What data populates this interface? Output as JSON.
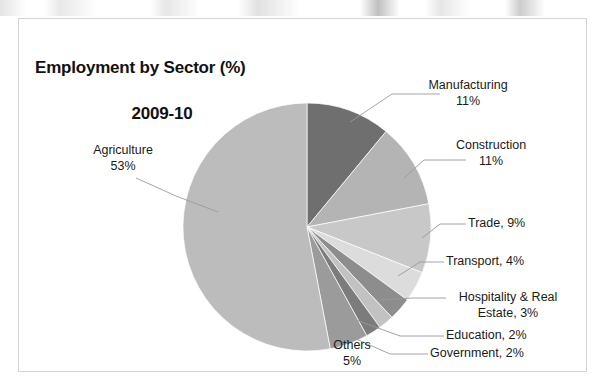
{
  "chart_data": {
    "type": "pie",
    "title": "Employment by Sector (%)",
    "subtitle": "2009-10",
    "title_line1": "Employment by Sector (%)",
    "title_line2": "2009-10",
    "units": "%",
    "start_angle_deg": 0,
    "direction": "clockwise",
    "legend": "none",
    "labels_position": "outside-with-leader-lines",
    "categories": [
      "Manufacturing",
      "Construction",
      "Trade",
      "Transport",
      "Hospitality & Real Estate",
      "Education",
      "Government",
      "Others",
      "Agriculture"
    ],
    "values": [
      11,
      11,
      9,
      4,
      3,
      2,
      2,
      5,
      53
    ],
    "colors": [
      "#6f6f6f",
      "#b4b4b4",
      "#c8c8c8",
      "#dcdcdc",
      "#8d8d8d",
      "#c2c2c2",
      "#7c7c7c",
      "#9b9b9b",
      "#bcbcbc"
    ],
    "slices": [
      {
        "name": "Manufacturing",
        "value": 11,
        "color": "#6f6f6f"
      },
      {
        "name": "Construction",
        "value": 11,
        "color": "#b4b4b4"
      },
      {
        "name": "Trade",
        "value": 9,
        "color": "#c8c8c8"
      },
      {
        "name": "Transport",
        "value": 4,
        "color": "#dcdcdc"
      },
      {
        "name": "Hospitality & Real Estate",
        "value": 3,
        "color": "#8d8d8d"
      },
      {
        "name": "Education",
        "value": 2,
        "color": "#c2c2c2"
      },
      {
        "name": "Government",
        "value": 2,
        "color": "#7c7c7c"
      },
      {
        "name": "Others",
        "value": 5,
        "color": "#9b9b9b"
      },
      {
        "name": "Agriculture",
        "value": 53,
        "color": "#bcbcbc"
      }
    ]
  },
  "labels": {
    "manufacturing": "Manufacturing\n11%",
    "construction": "Construction\n11%",
    "trade": "Trade, 9%",
    "transport": "Transport, 4%",
    "hospitality": "Hospitality & Real\nEstate, 3%",
    "education": "Education, 2%",
    "government": "Government, 2%",
    "others": "Others\n5%",
    "agriculture": "Agriculture\n53%"
  }
}
